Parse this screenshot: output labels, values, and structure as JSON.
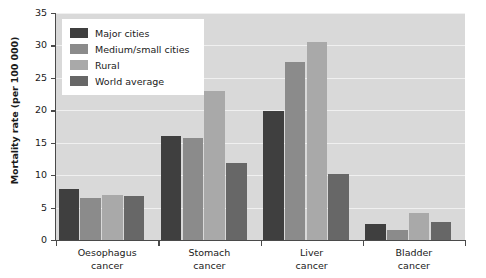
{
  "chart_data": {
    "type": "bar",
    "title": "",
    "xlabel": "",
    "ylabel": "Mortality rate (per 100 000)",
    "ylim": [
      0,
      35
    ],
    "yticks": [
      0,
      5,
      10,
      15,
      20,
      25,
      30,
      35
    ],
    "ytick_labels": [
      "0",
      "5",
      "10",
      "15",
      "20",
      "25",
      "30",
      "35"
    ],
    "grid": true,
    "legend_position": "upper-left-inside",
    "categories": [
      "Oesophagus cancer",
      "Stomach cancer",
      "Liver cancer",
      "Bladder cancer"
    ],
    "category_lines": [
      [
        "Oesophagus",
        "cancer"
      ],
      [
        "Stomach",
        "cancer"
      ],
      [
        "Liver",
        "cancer"
      ],
      [
        "Bladder",
        "cancer"
      ]
    ],
    "series": [
      {
        "name": "Major cities",
        "color": "#3f3f3f",
        "values": [
          7.9,
          16.0,
          19.9,
          2.5
        ]
      },
      {
        "name": "Medium/small cities",
        "color": "#8b8b8b",
        "values": [
          6.5,
          15.8,
          27.4,
          1.5
        ]
      },
      {
        "name": "Rural",
        "color": "#a9a9a9",
        "values": [
          6.9,
          23.0,
          30.6,
          4.2
        ]
      },
      {
        "name": "World average",
        "color": "#676767",
        "values": [
          6.8,
          11.9,
          10.2,
          2.8
        ]
      }
    ]
  },
  "plot": {
    "background_color": "#d9d9d9",
    "gridline_color": "#f0f0f0",
    "axis_color": "#4a4a4a"
  }
}
